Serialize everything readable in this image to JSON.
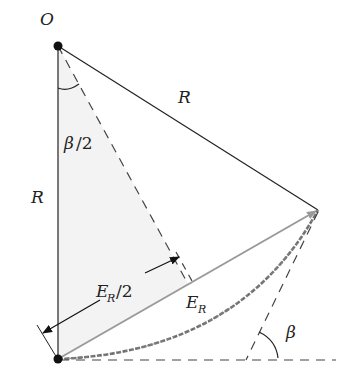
{
  "diagram": {
    "points": {
      "O": {
        "label": "O",
        "x": 58,
        "y": 46
      },
      "bottom": {
        "x": 58,
        "y": 359
      },
      "right": {
        "x": 318,
        "y": 210
      },
      "chord_mid": {
        "x": 188,
        "y": 284
      }
    },
    "labels": {
      "origin": "O",
      "radius_top": "R",
      "radius_left": "R",
      "half_angle_base": "β",
      "half_angle_den": "/2",
      "half_chord_base": "E",
      "half_chord_sub": "R",
      "half_chord_den": "/2",
      "chord_base": "E",
      "chord_sub": "R",
      "angle": "β"
    },
    "colors": {
      "line": "#222222",
      "chord": "#9a9a9a",
      "arc": "#7a7a7a",
      "dashed": "#444444",
      "shade": "#f3f3f3"
    }
  }
}
